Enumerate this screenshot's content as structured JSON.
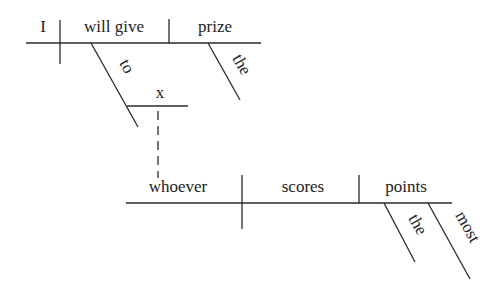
{
  "diagram": {
    "type": "Reed-Kellogg sentence diagram",
    "main_clause": {
      "subject": "I",
      "verb": "will give",
      "object": "prize",
      "object_modifier": "the",
      "preposition": "to",
      "prepositional_object": "x"
    },
    "noun_clause": {
      "subject": "whoever",
      "verb": "scores",
      "object": "points",
      "object_modifiers": [
        "the",
        "most"
      ]
    }
  }
}
